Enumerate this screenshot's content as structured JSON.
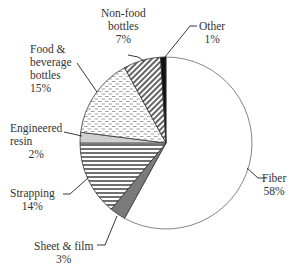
{
  "chart_data": {
    "type": "pie",
    "title": "",
    "start_angle": "12 o'clock, clockwise",
    "slices": [
      {
        "label": "Fiber",
        "value": 58,
        "display": "58%",
        "fill": "#ffffff",
        "pattern": "none"
      },
      {
        "label": "Sheet & film",
        "value": 3,
        "display": "3%",
        "fill": "#808080",
        "pattern": "solid-gray"
      },
      {
        "label": "Strapping",
        "value": 14,
        "display": "14%",
        "fill": "#ffffff",
        "pattern": "horizontal-lines"
      },
      {
        "label": "Engineered resin",
        "value": 2,
        "display": "2%",
        "fill": "#c8c8c8",
        "pattern": "solid-light-gray"
      },
      {
        "label": "Food & beverage bottles",
        "value": 15,
        "display": "15%",
        "fill": "#ffffff",
        "pattern": "dashed-dots"
      },
      {
        "label": "Non-food bottles",
        "value": 7,
        "display": "7%",
        "fill": "#ffffff",
        "pattern": "diagonal-lines"
      },
      {
        "label": "Other",
        "value": 1,
        "display": "1%",
        "fill": "#111111",
        "pattern": "solid-black"
      }
    ],
    "legend": "none (callout labels)"
  },
  "labels": {
    "fiber": {
      "line1": "Fiber",
      "line2": "58%"
    },
    "sheet": {
      "line1": "Sheet & film",
      "line2": "3%"
    },
    "strapping": {
      "line1": "Strapping",
      "line2": "14%"
    },
    "resin": {
      "line1": "Engineered",
      "line2": "resin",
      "line3": "2%"
    },
    "food": {
      "line1": "Food &",
      "line2": "beverage",
      "line3": "bottles",
      "line4": "15%"
    },
    "nonfood": {
      "line1": "Non-food",
      "line2": "bottles",
      "line3": "7%"
    },
    "other": {
      "line1": "Other",
      "line2": "1%"
    }
  }
}
